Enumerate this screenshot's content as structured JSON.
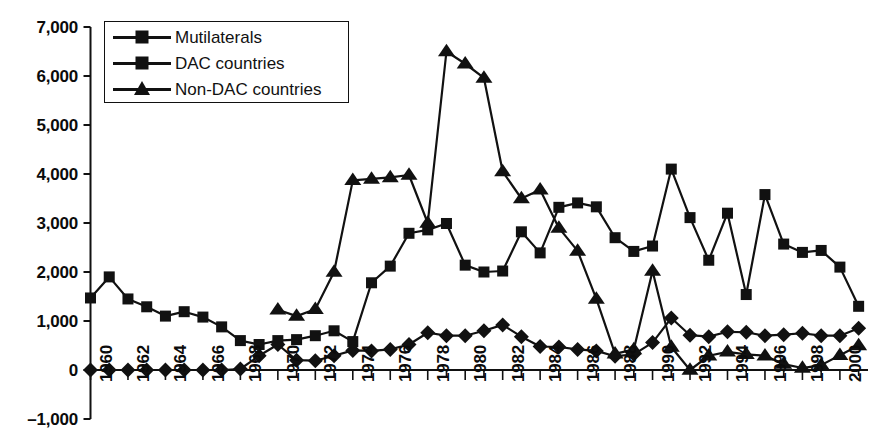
{
  "chart_data": {
    "type": "line",
    "title": "",
    "subtitle": "",
    "xlabel": "",
    "ylabel": "",
    "xlim": [
      1960,
      2001
    ],
    "ylim": [
      -1000,
      7000
    ],
    "grid": false,
    "legend_position": "top-left",
    "y_ticks": [
      {
        "value": 7000,
        "label": "7,000"
      },
      {
        "value": 6000,
        "label": "6,000"
      },
      {
        "value": 5000,
        "label": "5,000"
      },
      {
        "value": 4000,
        "label": "4,000"
      },
      {
        "value": 3000,
        "label": "3,000"
      },
      {
        "value": 2000,
        "label": "2,000"
      },
      {
        "value": 1000,
        "label": "1,000"
      },
      {
        "value": 0,
        "label": "0"
      },
      {
        "value": -1000,
        "label": "–1,000"
      }
    ],
    "x_tick_labels": [
      "1960",
      "1962",
      "1964",
      "1966",
      "1968",
      "1970",
      "1972",
      "1974",
      "1976",
      "1978",
      "1980",
      "1982",
      "1984",
      "1986",
      "1988",
      "1990",
      "1992",
      "1994",
      "1996",
      "1998",
      "2000"
    ],
    "x": [
      1960,
      1961,
      1962,
      1963,
      1964,
      1965,
      1966,
      1967,
      1968,
      1969,
      1970,
      1971,
      1972,
      1973,
      1974,
      1975,
      1976,
      1977,
      1978,
      1979,
      1980,
      1981,
      1982,
      1983,
      1984,
      1985,
      1986,
      1987,
      1988,
      1989,
      1990,
      1991,
      1992,
      1993,
      1994,
      1995,
      1996,
      1997,
      1998,
      1999,
      2000,
      2001
    ],
    "series": [
      {
        "name": "Mutilaterals",
        "marker": "diamond",
        "color": "#111111",
        "values": [
          0,
          0,
          0,
          0,
          0,
          0,
          0,
          0,
          20,
          290,
          520,
          200,
          190,
          290,
          400,
          390,
          420,
          520,
          760,
          700,
          700,
          800,
          920,
          680,
          480,
          470,
          420,
          390,
          280,
          320,
          560,
          1060,
          710,
          680,
          780,
          770,
          700,
          720,
          750,
          700,
          700,
          850
        ]
      },
      {
        "name": "DAC countries",
        "marker": "square",
        "color": "#111111",
        "values": [
          1470,
          1900,
          1450,
          1290,
          1100,
          1190,
          1080,
          880,
          600,
          520,
          600,
          620,
          700,
          800,
          580,
          1780,
          2120,
          2790,
          2860,
          2990,
          2140,
          2000,
          2020,
          2820,
          2390,
          3320,
          3410,
          3330,
          2700,
          2420,
          2530,
          4100,
          3110,
          2240,
          3200,
          1540,
          3580,
          2570,
          2400,
          2440,
          2100,
          1300
        ]
      },
      {
        "name": "Non-DAC countries",
        "marker": "triangle",
        "color": "#111111",
        "values": [
          null,
          null,
          null,
          null,
          null,
          null,
          null,
          null,
          null,
          null,
          1230,
          1100,
          1240,
          2000,
          3870,
          3900,
          3930,
          3980,
          3000,
          6500,
          6250,
          5960,
          4050,
          3500,
          3680,
          2900,
          2430,
          1450,
          330,
          420,
          2020,
          470,
          0,
          290,
          370,
          320,
          290,
          120,
          40,
          100,
          300,
          500
        ]
      }
    ]
  },
  "legend": {
    "items": [
      {
        "label": "Mutilaterals",
        "marker": "diamond"
      },
      {
        "label": "DAC countries",
        "marker": "square"
      },
      {
        "label": "Non-DAC countries",
        "marker": "triangle"
      }
    ]
  }
}
